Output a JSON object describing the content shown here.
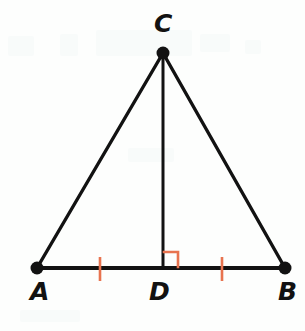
{
  "figure": {
    "background_color": "#fdfefd",
    "stroke_color": "#121212",
    "mark_color": "#e8734f",
    "width": 305,
    "height": 331
  },
  "labels": {
    "apex": "C",
    "left_base": "A",
    "foot": "D",
    "right_base": "B"
  },
  "points": {
    "C": {
      "x": 163,
      "y": 53,
      "dot_radius": 6.5
    },
    "A": {
      "x": 37,
      "y": 268,
      "dot_radius": 6.5
    },
    "B": {
      "x": 285,
      "y": 268,
      "dot_radius": 6.5
    },
    "D": {
      "x": 163,
      "y": 268,
      "dot_radius": 0
    }
  },
  "segments": [
    {
      "name": "side-AC",
      "from": "A",
      "to": "C",
      "x1": 37,
      "y1": 268,
      "x2": 163,
      "y2": 53,
      "width": 3.4
    },
    {
      "name": "side-CB",
      "from": "C",
      "to": "B",
      "x1": 163,
      "y1": 53,
      "x2": 285,
      "y2": 268,
      "width": 3.4
    },
    {
      "name": "base-AB",
      "from": "A",
      "to": "B",
      "x1": 37,
      "y1": 268,
      "x2": 285,
      "y2": 268,
      "width": 3.8
    },
    {
      "name": "altitude-CD",
      "from": "C",
      "to": "D",
      "x1": 163,
      "y1": 53,
      "x2": 163,
      "y2": 268,
      "width": 3.0
    }
  ],
  "marks": {
    "right_angle": {
      "name": "right-angle-at-D",
      "vertex_x": 163,
      "vertex_y": 268,
      "size": 15,
      "side": "right",
      "color": "#e8734f",
      "width": 2.6
    },
    "congruence_ticks": [
      {
        "name": "tick-AD",
        "segment": "AD",
        "x": 100,
        "y1": 257,
        "y2": 281,
        "color": "#e8734f",
        "width": 2.6
      },
      {
        "name": "tick-DB",
        "segment": "DB",
        "x": 222,
        "y1": 257,
        "y2": 281,
        "color": "#e8734f",
        "width": 2.6
      }
    ]
  },
  "scan_artifacts": [
    {
      "x": 8,
      "y": 36,
      "w": 26,
      "h": 20
    },
    {
      "x": 60,
      "y": 34,
      "w": 18,
      "h": 22
    },
    {
      "x": 96,
      "y": 30,
      "w": 96,
      "h": 26
    },
    {
      "x": 200,
      "y": 34,
      "w": 30,
      "h": 18
    },
    {
      "x": 245,
      "y": 40,
      "w": 16,
      "h": 14
    },
    {
      "x": 128,
      "y": 148,
      "w": 46,
      "h": 14
    },
    {
      "x": 20,
      "y": 310,
      "w": 60,
      "h": 12
    }
  ]
}
